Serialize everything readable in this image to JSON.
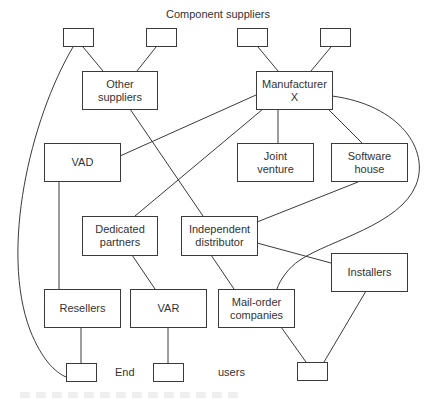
{
  "diagram": {
    "title": "Component suppliers",
    "bottom_labels": {
      "left": "End",
      "right": "users"
    },
    "line_color": "#3a3a3a",
    "nodes": {
      "supplier_box_1": {
        "label": ""
      },
      "supplier_box_2": {
        "label": ""
      },
      "supplier_box_3": {
        "label": ""
      },
      "supplier_box_4": {
        "label": ""
      },
      "other_suppliers": {
        "line1": "Other",
        "line2": "suppliers"
      },
      "manufacturer_x": {
        "line1": "Manufacturer",
        "line2": "X"
      },
      "vad": {
        "line1": "VAD"
      },
      "joint_venture": {
        "line1": "Joint",
        "line2": "venture"
      },
      "software_house": {
        "line1": "Software",
        "line2": "house"
      },
      "dedicated_partners": {
        "line1": "Dedicated",
        "line2": "partners"
      },
      "independent_distributor": {
        "line1": "Independent",
        "line2": "distributor"
      },
      "installers": {
        "line1": "Installers"
      },
      "resellers": {
        "line1": "Resellers"
      },
      "var": {
        "line1": "VAR"
      },
      "mail_order": {
        "line1": "Mail-order",
        "line2": "companies"
      },
      "end_user_box_1": {
        "label": ""
      },
      "end_user_box_2": {
        "label": ""
      },
      "end_user_box_3": {
        "label": ""
      }
    },
    "edges": [
      [
        "supplier_box_1",
        "other_suppliers"
      ],
      [
        "supplier_box_2",
        "other_suppliers"
      ],
      [
        "supplier_box_3",
        "manufacturer_x"
      ],
      [
        "supplier_box_4",
        "manufacturer_x"
      ],
      [
        "supplier_box_1",
        "end_user_box_1"
      ],
      [
        "other_suppliers",
        "independent_distributor"
      ],
      [
        "manufacturer_x",
        "vad"
      ],
      [
        "manufacturer_x",
        "dedicated_partners"
      ],
      [
        "manufacturer_x",
        "joint_venture"
      ],
      [
        "manufacturer_x",
        "software_house"
      ],
      [
        "manufacturer_x",
        "mail_order"
      ],
      [
        "software_house",
        "independent_distributor"
      ],
      [
        "vad",
        "resellers"
      ],
      [
        "dedicated_partners",
        "var"
      ],
      [
        "independent_distributor",
        "mail_order"
      ],
      [
        "independent_distributor",
        "installers"
      ],
      [
        "resellers",
        "end_user_box_1"
      ],
      [
        "var",
        "end_user_box_2"
      ],
      [
        "mail_order",
        "end_user_box_3"
      ],
      [
        "installers",
        "end_user_box_3"
      ]
    ]
  }
}
